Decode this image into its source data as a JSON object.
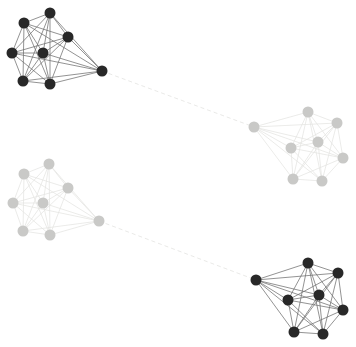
{
  "figure": {
    "type": "network-graph",
    "background": "#ffffff",
    "canvas": {
      "width": 356,
      "height": 347
    },
    "node_radius": 5.5,
    "clusters": [
      {
        "id": "top-left-dark",
        "node_color": "#282828",
        "edge_color": "#6f6f6f",
        "edge_width": 0.75,
        "intra_edges": "complete",
        "node_count": 8,
        "nodes": [
          [
            50,
            13
          ],
          [
            24,
            23
          ],
          [
            68,
            37
          ],
          [
            12,
            53
          ],
          [
            43,
            53
          ],
          [
            23,
            81
          ],
          [
            50,
            84
          ],
          [
            102,
            71
          ]
        ]
      },
      {
        "id": "middle-right-light",
        "node_color": "#c9c9c7",
        "edge_color": "#e4e4e2",
        "edge_width": 0.75,
        "intra_edges": "complete",
        "node_count": 8,
        "nodes": [
          [
            254,
            127
          ],
          [
            308,
            112
          ],
          [
            337,
            123
          ],
          [
            291,
            148
          ],
          [
            318,
            142
          ],
          [
            343,
            158
          ],
          [
            293,
            179
          ],
          [
            322,
            181
          ]
        ]
      },
      {
        "id": "middle-left-light",
        "node_color": "#c9c9c7",
        "edge_color": "#e4e4e2",
        "edge_width": 0.75,
        "intra_edges": "complete",
        "node_count": 8,
        "nodes": [
          [
            49,
            164
          ],
          [
            24,
            174
          ],
          [
            68,
            188
          ],
          [
            13,
            203
          ],
          [
            43,
            203
          ],
          [
            23,
            231
          ],
          [
            50,
            235
          ],
          [
            99,
            221
          ]
        ]
      },
      {
        "id": "bottom-right-dark",
        "node_color": "#282828",
        "edge_color": "#6f6f6f",
        "edge_width": 0.75,
        "intra_edges": "complete",
        "node_count": 8,
        "nodes": [
          [
            256,
            280
          ],
          [
            308,
            263
          ],
          [
            338,
            273
          ],
          [
            288,
            300
          ],
          [
            319,
            295
          ],
          [
            343,
            310
          ],
          [
            294,
            332
          ],
          [
            323,
            334
          ]
        ]
      }
    ],
    "bridge_edges": [
      {
        "from_cluster": "top-left-dark",
        "from_node": 7,
        "to_cluster": "middle-right-light",
        "to_node": 0,
        "color": "#e6e6e4",
        "width": 0.9,
        "style": "dashed",
        "dash": "4 3"
      },
      {
        "from_cluster": "middle-left-light",
        "from_node": 7,
        "to_cluster": "bottom-right-dark",
        "to_node": 0,
        "color": "#e6e6e4",
        "width": 0.9,
        "style": "dashed",
        "dash": "4 3"
      }
    ]
  }
}
